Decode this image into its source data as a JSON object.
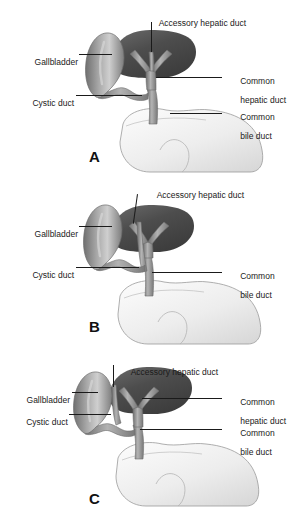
{
  "figure": {
    "title_present": false,
    "background_color": "#ffffff",
    "text_color": "#1a1a1a",
    "leader_color": "#1a1a1a",
    "duct_fill": "#8c8c8c",
    "liver_fill": "#4a4a4a",
    "gallbladder_fill": "#9a9a9a",
    "duodenum_fill": "#f2f2f2"
  },
  "panels": [
    {
      "id": "A",
      "letter": "A",
      "caption_note": "Accessory hepatic duct joining the common hepatic duct",
      "labels": [
        {
          "name": "gallbladder",
          "text": "Gallbladder",
          "text2": "",
          "side": "left"
        },
        {
          "name": "cystic-duct",
          "text": "Cystic duct",
          "text2": "",
          "side": "left"
        },
        {
          "name": "accessory-hepatic-duct",
          "text": "Accessory hepatic duct",
          "text2": "",
          "side": "top"
        },
        {
          "name": "common-hepatic-duct",
          "text": "Common",
          "text2": "hepatic duct",
          "side": "right"
        },
        {
          "name": "common-bile-duct",
          "text": "Common",
          "text2": "bile duct",
          "side": "right"
        }
      ]
    },
    {
      "id": "B",
      "letter": "B",
      "caption_note": "Accessory hepatic duct joining the common bile duct",
      "labels": [
        {
          "name": "gallbladder",
          "text": "Gallbladder",
          "text2": "",
          "side": "left"
        },
        {
          "name": "cystic-duct",
          "text": "Cystic duct",
          "text2": "",
          "side": "left"
        },
        {
          "name": "accessory-hepatic-duct",
          "text": "Accessory hepatic duct",
          "text2": "",
          "side": "top"
        },
        {
          "name": "common-bile-duct",
          "text": "Common",
          "text2": "bile duct",
          "side": "right"
        }
      ]
    },
    {
      "id": "C",
      "letter": "C",
      "caption_note": "Accessory hepatic duct joining the cystic duct",
      "labels": [
        {
          "name": "gallbladder",
          "text": "Gallbladder",
          "text2": "",
          "side": "left"
        },
        {
          "name": "cystic-duct",
          "text": "Cystic duct",
          "text2": "",
          "side": "left"
        },
        {
          "name": "accessory-hepatic-duct",
          "text": "Accessory hepatic duct",
          "text2": "",
          "side": "top"
        },
        {
          "name": "common-hepatic-duct",
          "text": "Common",
          "text2": "hepatic duct",
          "side": "right"
        },
        {
          "name": "common-bile-duct",
          "text": "Common",
          "text2": "bile duct",
          "side": "right"
        }
      ]
    }
  ]
}
